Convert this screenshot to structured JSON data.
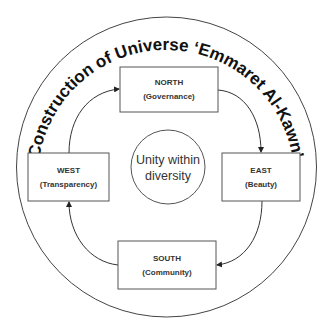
{
  "diagram": {
    "title": "Construction of Universe ‘Emmaret Al-Kawn’",
    "center": {
      "line1": "Unity within",
      "line2": "diversity"
    },
    "nodes": {
      "north": {
        "title": "NORTH",
        "subtitle": "(Governance)"
      },
      "east": {
        "title": "EAST",
        "subtitle": "(Beauty)"
      },
      "south": {
        "title": "SOUTH",
        "subtitle": "(Community)"
      },
      "west": {
        "title": "WEST",
        "subtitle": "(Transparency)"
      }
    },
    "flow": [
      "west",
      "north",
      "east",
      "south",
      "west"
    ],
    "colors": {
      "stroke": "#444444",
      "text": "#333333",
      "background": "#ffffff"
    }
  }
}
